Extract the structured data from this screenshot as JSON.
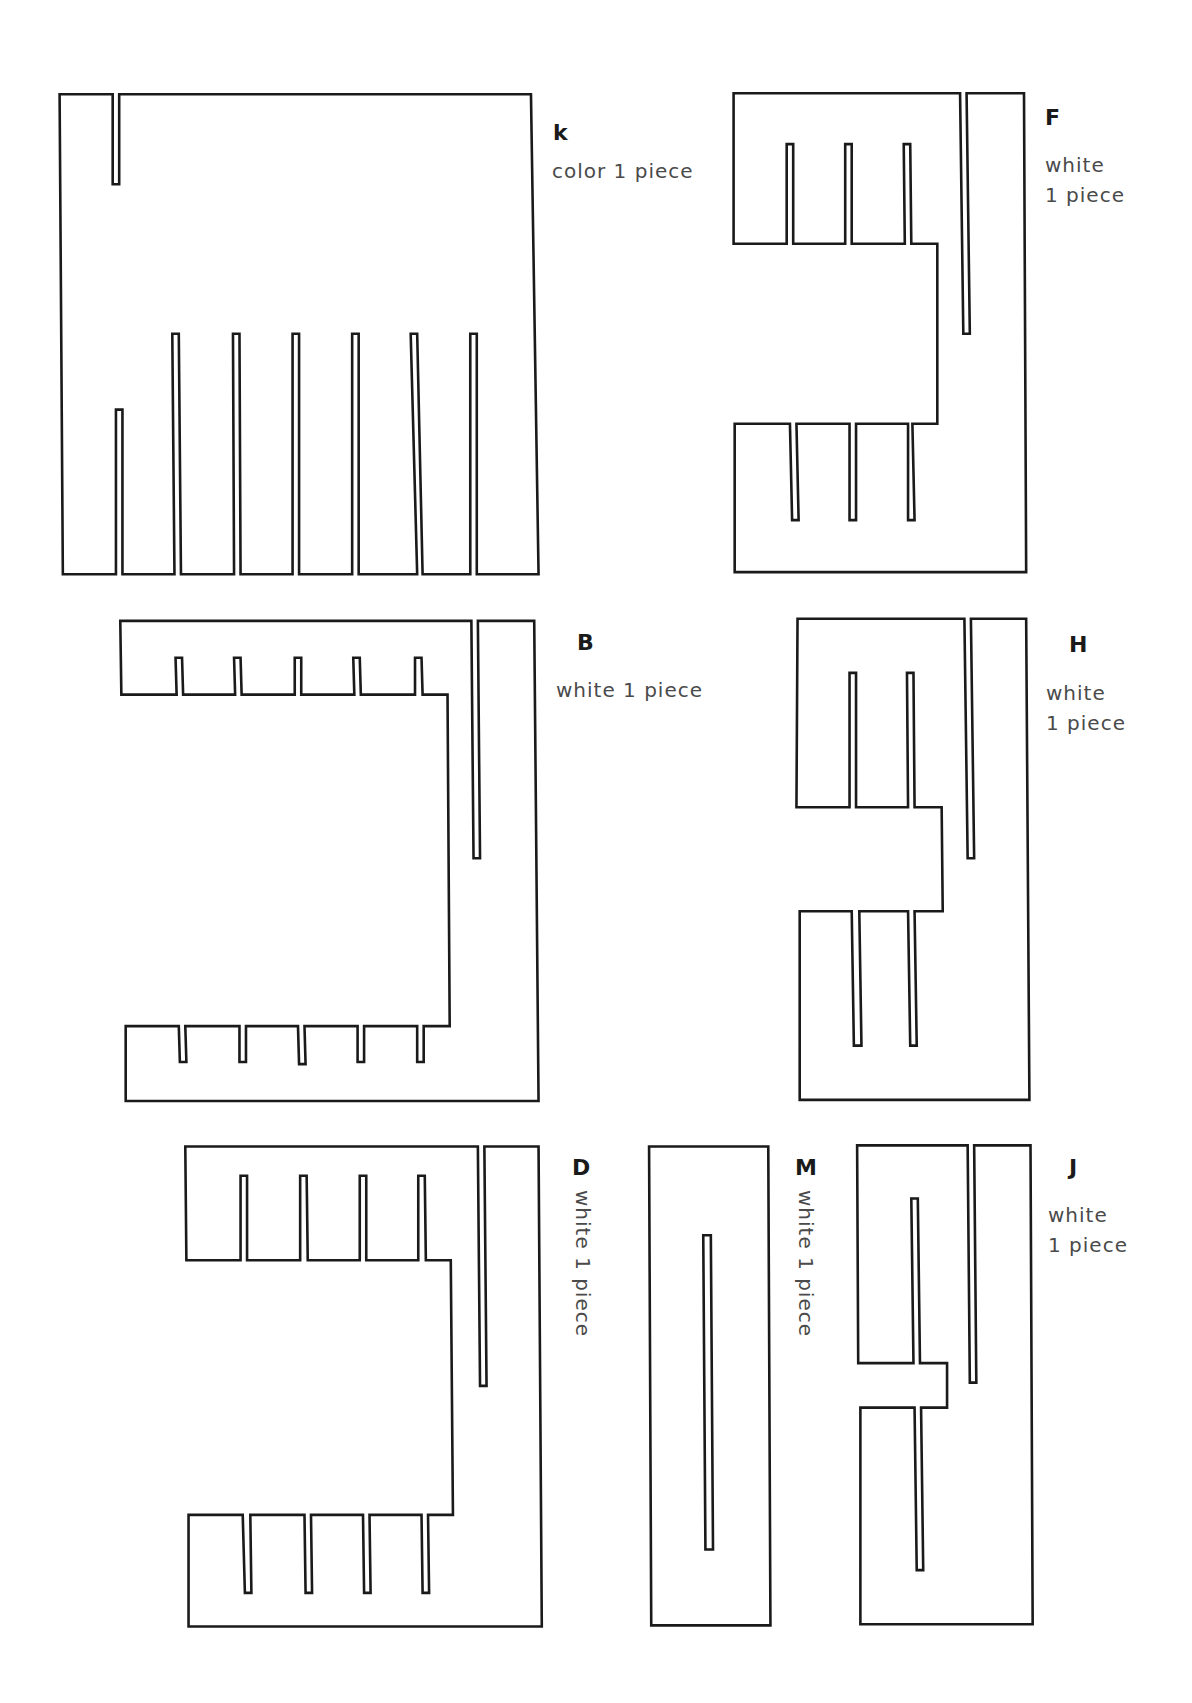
{
  "pieces": [
    {
      "id": "k",
      "label": "k",
      "description": "color 1 piece",
      "color": "color",
      "quantity": 1,
      "slots_top": 1,
      "slots_bottom": 7
    },
    {
      "id": "F",
      "label": "F",
      "description": "white\n1 piece",
      "color": "white",
      "quantity": 1,
      "slots_top": 3,
      "slots_bottom": 3
    },
    {
      "id": "B",
      "label": "B",
      "description": "white 1 piece",
      "color": "white",
      "quantity": 1,
      "slots_top": 5,
      "slots_bottom": 5
    },
    {
      "id": "H",
      "label": "H",
      "description": "white\n1 piece",
      "color": "white",
      "quantity": 1,
      "slots_top": 2,
      "slots_bottom": 2
    },
    {
      "id": "D",
      "label": "D",
      "description": "white 1 piece",
      "color": "white",
      "quantity": 1,
      "slots_top": 4,
      "slots_bottom": 4
    },
    {
      "id": "M",
      "label": "M",
      "description": "white 1 piece",
      "color": "white",
      "quantity": 1,
      "slots_top": 0,
      "slots_bottom": 0
    },
    {
      "id": "J",
      "label": "J",
      "description": "white\n1 piece",
      "color": "white",
      "quantity": 1,
      "slots_top": 1,
      "slots_bottom": 1
    }
  ],
  "colors": {
    "outline": "#1a1a1a",
    "text": "#4a4a4a",
    "background": "#ffffff"
  }
}
